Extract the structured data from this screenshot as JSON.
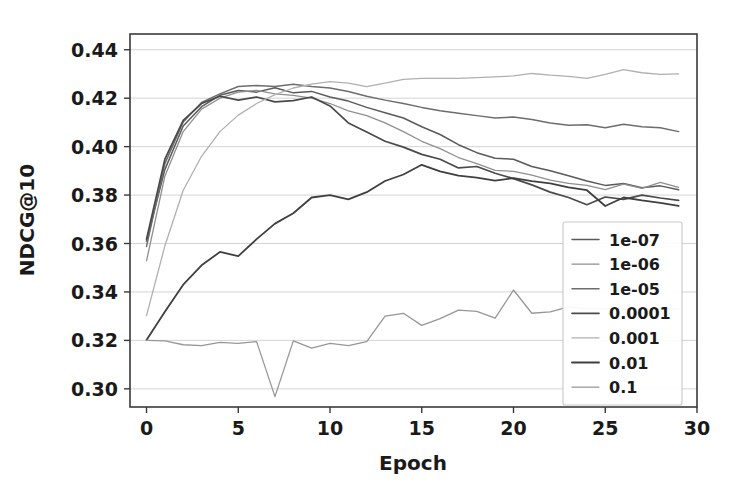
{
  "chart_data": {
    "type": "line",
    "title": "",
    "xlabel": "Epoch",
    "ylabel": "NDCG@10",
    "xlim": [
      -0.9,
      30
    ],
    "ylim": [
      0.2925,
      0.4465
    ],
    "xticks": [
      0,
      5,
      10,
      15,
      20,
      25,
      30
    ],
    "xtick_labels": [
      "0",
      "5",
      "10",
      "15",
      "20",
      "25",
      "30"
    ],
    "yticks": [
      0.3,
      0.32,
      0.34,
      0.36,
      0.38,
      0.4,
      0.42,
      0.44
    ],
    "ytick_labels": [
      "0.30",
      "0.32",
      "0.34",
      "0.36",
      "0.38",
      "0.40",
      "0.42",
      "0.44"
    ],
    "grid": true,
    "grid_axis": "y",
    "legend_position": "lower right",
    "x": [
      0,
      1,
      2,
      3,
      4,
      5,
      6,
      7,
      8,
      9,
      10,
      11,
      12,
      13,
      14,
      15,
      16,
      17,
      18,
      19,
      20,
      21,
      22,
      23,
      24,
      25,
      26,
      27,
      28,
      29
    ],
    "series": [
      {
        "name": "1e-07",
        "color": "#5a5a5a",
        "width": 1.5,
        "values": [
          0.361,
          0.3905,
          0.4085,
          0.4165,
          0.4212,
          0.4232,
          0.4225,
          0.4243,
          0.4222,
          0.4228,
          0.4205,
          0.4188,
          0.4162,
          0.414,
          0.4118,
          0.4082,
          0.405,
          0.4008,
          0.3975,
          0.3952,
          0.3948,
          0.3918,
          0.39,
          0.388,
          0.3858,
          0.384,
          0.3848,
          0.383,
          0.3838,
          0.3822
        ]
      },
      {
        "name": "1e-06",
        "color": "#8f8f8f",
        "width": 1.3,
        "values": [
          0.3528,
          0.3878,
          0.4062,
          0.4155,
          0.42,
          0.4225,
          0.4232,
          0.4218,
          0.4212,
          0.42,
          0.4178,
          0.4148,
          0.4128,
          0.4098,
          0.4062,
          0.4022,
          0.3992,
          0.3955,
          0.393,
          0.3902,
          0.3898,
          0.3882,
          0.3862,
          0.3848,
          0.384,
          0.3822,
          0.3845,
          0.3828,
          0.3852,
          0.3832
        ]
      },
      {
        "name": "1e-05",
        "color": "#6d6d6d",
        "width": 1.5,
        "values": [
          0.3588,
          0.393,
          0.4102,
          0.4182,
          0.4218,
          0.4248,
          0.4252,
          0.4248,
          0.4258,
          0.4248,
          0.4242,
          0.4228,
          0.4208,
          0.4192,
          0.4178,
          0.4162,
          0.4148,
          0.4138,
          0.4128,
          0.4118,
          0.4122,
          0.4112,
          0.4098,
          0.4088,
          0.409,
          0.4078,
          0.4092,
          0.4082,
          0.4078,
          0.4062
        ]
      },
      {
        "name": "0.0001",
        "color": "#4a4a4a",
        "width": 1.7,
        "values": [
          0.3618,
          0.3948,
          0.4108,
          0.4178,
          0.4208,
          0.4192,
          0.4205,
          0.4185,
          0.419,
          0.4205,
          0.4168,
          0.4098,
          0.406,
          0.4022,
          0.3998,
          0.3968,
          0.3948,
          0.3912,
          0.3918,
          0.389,
          0.3868,
          0.3842,
          0.3812,
          0.379,
          0.376,
          0.3792,
          0.3782,
          0.38,
          0.3788,
          0.3778
        ]
      },
      {
        "name": "0.001",
        "color": "#b0b0b0",
        "width": 1.3,
        "values": [
          0.3302,
          0.359,
          0.382,
          0.396,
          0.4062,
          0.413,
          0.4178,
          0.4215,
          0.4242,
          0.4258,
          0.4268,
          0.4262,
          0.4248,
          0.4262,
          0.4278,
          0.4282,
          0.4282,
          0.4282,
          0.4285,
          0.4288,
          0.4292,
          0.4302,
          0.4295,
          0.429,
          0.4282,
          0.4298,
          0.4318,
          0.4305,
          0.4298,
          0.43
        ]
      },
      {
        "name": "0.01",
        "color": "#3f3f3f",
        "width": 1.8,
        "values": [
          0.3202,
          0.3318,
          0.343,
          0.351,
          0.3565,
          0.3548,
          0.3618,
          0.3682,
          0.3725,
          0.379,
          0.38,
          0.3782,
          0.3812,
          0.3858,
          0.3885,
          0.3925,
          0.3898,
          0.388,
          0.3872,
          0.386,
          0.387,
          0.3858,
          0.3848,
          0.3832,
          0.382,
          0.3755,
          0.379,
          0.3778,
          0.3768,
          0.3755
        ]
      },
      {
        "name": "0.1",
        "color": "#979797",
        "width": 1.3,
        "values": [
          0.32,
          0.3198,
          0.3182,
          0.3178,
          0.3192,
          0.3188,
          0.3195,
          0.2968,
          0.3198,
          0.3168,
          0.3188,
          0.3178,
          0.3195,
          0.33,
          0.3312,
          0.3262,
          0.329,
          0.3325,
          0.332,
          0.3292,
          0.3408,
          0.3312,
          0.3318,
          0.3338,
          0.333,
          0.333,
          0.333,
          0.333,
          0.333,
          0.333
        ]
      }
    ]
  },
  "legend": {
    "entries": [
      {
        "label": "1e-07"
      },
      {
        "label": "1e-06"
      },
      {
        "label": "1e-05"
      },
      {
        "label": "0.0001"
      },
      {
        "label": "0.001"
      },
      {
        "label": "0.01"
      },
      {
        "label": "0.1"
      }
    ]
  }
}
